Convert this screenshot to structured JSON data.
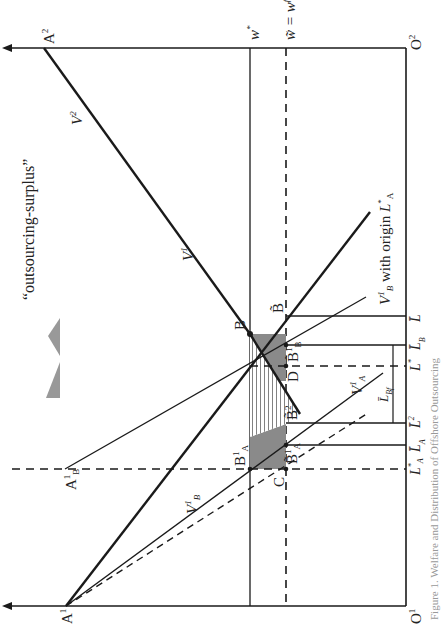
{
  "figure": {
    "orientation": "rotated 90 degrees counter-clockwise",
    "caption_faint": "Figure 1. Welfare and Distribution of Offshore Outsourcing",
    "legend": {
      "swatch_color": "#999999",
      "label": "“outsourcing-surplus”"
    },
    "colors": {
      "line": "#1a1a1a",
      "surplus_fill": "#8a8a8a",
      "hatch": "#1a1a1a"
    },
    "origins": {
      "o1": "O",
      "o1_sup": "1",
      "o2": "O",
      "o2_sup": "2"
    },
    "points": {
      "a1": "A",
      "a1_sup": "1",
      "a2": "A",
      "a2_sup": "2",
      "a1b": "A",
      "a1b_sup": "1",
      "a1b_sub": "B",
      "b": "B",
      "b_tilde": "B̃",
      "b1a": "B",
      "b1a_sup": "1",
      "b1a_sub": "A",
      "b_tilde_1a": "B̃",
      "b_tilde_1a_sup": "1",
      "b_tilde_1a_sub": "A",
      "b_tilde_1b": "B̃",
      "b_tilde_1b_sup": "1",
      "b_tilde_1b_sub": "B",
      "b_tilde_2": "B̃",
      "b_tilde_2_sup": "2",
      "c": "C",
      "d": "D"
    },
    "wage_lines": {
      "w_star": "w",
      "w_star_sup": "*",
      "w_tilde_eq": "w̃ = w",
      "w_tilde_sup": "f"
    },
    "curves": {
      "v2": "V",
      "v2_sup": "2",
      "v1": "V",
      "v1_sup": "1",
      "v1a": "V",
      "v1a_sup": "1",
      "v1a_sub": "A",
      "v1b_dashed": "V",
      "v1b_dashed_sup": "1",
      "v1b_dashed_sub": "B",
      "v1b_origin": "V",
      "v1b_origin_sup": "1",
      "v1b_origin_sub": "B",
      "v1b_origin_text": " with origin ",
      "v1b_origin_L": "L",
      "v1b_origin_L_sup": "*",
      "v1b_origin_L_sub": "A"
    },
    "axis_labels": [
      {
        "text": "L",
        "sup": "*",
        "sub": "A"
      },
      {
        "text": "L̄",
        "sup": "",
        "sub": "A"
      },
      {
        "text": "L̄",
        "sup": "2",
        "sub": ""
      },
      {
        "text": "L",
        "sup": "*",
        "sub": ""
      },
      {
        "text": "L̄",
        "sup": "",
        "sub": "B"
      },
      {
        "text": "L̄",
        "sup": "1",
        "sub": ""
      },
      {
        "text": "L̄",
        "sup": "",
        "sub": ""
      }
    ],
    "bracket_label": {
      "text": "L̄",
      "sub": "Bf"
    }
  }
}
